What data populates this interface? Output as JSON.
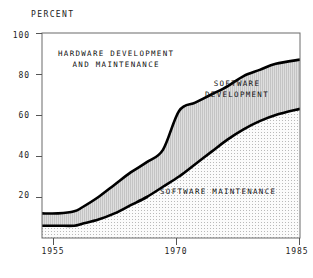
{
  "chart_data": {
    "type": "area",
    "title": "",
    "subtitle": "",
    "ylabel": "PERCENT",
    "xlabel": "",
    "grid": false,
    "legend_position": "in-plot-annotations",
    "xlim": [
      1953,
      1985
    ],
    "ylim": [
      0,
      100
    ],
    "ytick_labels": [
      "100",
      "80",
      "60",
      "40",
      "20"
    ],
    "ytick_values": [
      100,
      80,
      60,
      40,
      20
    ],
    "xtick_labels": [
      "1955",
      "1970",
      "1985"
    ],
    "xtick_values": [
      1955,
      1970,
      1985
    ],
    "stacking": "cumulative-from-bottom",
    "x": [
      1953,
      1955,
      1957,
      1958,
      1960,
      1962,
      1964,
      1966,
      1968,
      1970,
      1972,
      1974,
      1976,
      1978,
      1980,
      1982,
      1985
    ],
    "series": [
      {
        "name": "SOFTWARE MAINTENANCE",
        "label": "SOFTWARE MAINTENANCE",
        "fill": "light-dotted",
        "color": "#f2f2f2",
        "boundary_note": "lower curve: cumulative top of software maintenance band",
        "values": [
          6,
          6,
          6,
          7,
          9,
          12,
          16,
          20,
          25,
          30,
          36,
          42,
          48,
          53,
          57,
          60,
          63
        ]
      },
      {
        "name": "SOFTWARE DEVELOPMENT",
        "label": "SOFTWARE DEVELOPMENT",
        "fill": "medium-gray",
        "color": "#d0d0d0",
        "boundary_note": "upper curve: cumulative top of software development band",
        "values": [
          6,
          6,
          7,
          8,
          11,
          14,
          16,
          17,
          18,
          32,
          30,
          28,
          26,
          26,
          25,
          25,
          24
        ]
      },
      {
        "name": "HARDWARE DEVELOPMENT AND MAINTENANCE",
        "label": "HARDWARE DEVELOPMENT AND MAINTENANCE",
        "fill": "white",
        "color": "#ffffff",
        "boundary_note": "remainder above upper curve up to 100%",
        "values": [
          88,
          88,
          87,
          85,
          80,
          74,
          68,
          63,
          57,
          38,
          34,
          30,
          26,
          21,
          18,
          15,
          13
        ]
      }
    ],
    "cumulative_lower_curve": [
      6,
      6,
      6,
      7,
      9,
      12,
      16,
      20,
      25,
      30,
      36,
      42,
      48,
      53,
      57,
      60,
      63
    ],
    "cumulative_upper_curve": [
      12,
      12,
      13,
      15,
      20,
      26,
      32,
      37,
      43,
      62,
      66,
      70,
      74,
      79,
      82,
      85,
      87
    ],
    "annotations": [
      {
        "id": "hardware",
        "text_lines": [
          "HARDWARE DEVELOPMENT",
          "AND MAINTENANCE"
        ],
        "boxed": false
      },
      {
        "id": "software_development",
        "text_lines": [
          "SOFTWARE",
          "DEVELOPMENT"
        ],
        "boxed": true
      },
      {
        "id": "software_maintenance",
        "text_lines": [
          "SOFTWARE MAINTENANCE"
        ],
        "boxed": false
      }
    ]
  },
  "axes": {
    "unit_label": "PERCENT",
    "y_ticks": [
      {
        "label": "100"
      },
      {
        "label": "80"
      },
      {
        "label": "60"
      },
      {
        "label": "40"
      },
      {
        "label": "20"
      }
    ],
    "x_ticks": [
      {
        "label": "1955"
      },
      {
        "label": "1970"
      },
      {
        "label": "1985"
      }
    ]
  },
  "annotations": {
    "hardware_line1": "HARDWARE DEVELOPMENT",
    "hardware_line2": "AND MAINTENANCE",
    "software_dev_line1": "SOFTWARE",
    "software_dev_line2": "DEVELOPMENT",
    "software_maint": "SOFTWARE MAINTENANCE"
  },
  "colors": {
    "frame": "#555555",
    "curve": "#000000",
    "band_development": "#d4d4d4",
    "band_maintenance": "#f4f4f4",
    "text": "#1a1a1a"
  }
}
